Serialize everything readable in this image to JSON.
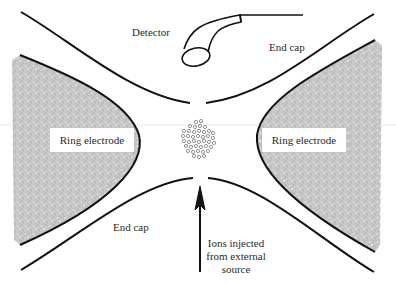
{
  "diagram": {
    "labels": {
      "detector": "Detector",
      "end_cap_top": "End cap",
      "end_cap_bottom": "End cap",
      "ring_electrode_left": "Ring electrode",
      "ring_electrode_right": "Ring electrode",
      "ions_injected": [
        "Ions injected",
        "from external",
        "source"
      ]
    },
    "colors": {
      "line": "#111111",
      "electrode_fill": "#c8c8c8",
      "ion": "#777777",
      "text": "#2a2a2a"
    },
    "components": [
      "detector",
      "end-cap-top",
      "ring-electrode-left",
      "ring-electrode-right",
      "end-cap-bottom",
      "ion-cloud",
      "injection-arrow"
    ]
  }
}
